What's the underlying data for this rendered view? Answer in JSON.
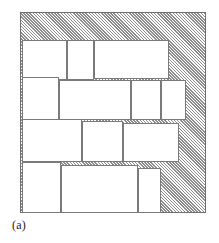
{
  "figure": {
    "caption": "(a)",
    "type": "two-dimensional-packing-diagram",
    "container": {
      "name": "stock-sheet",
      "fill": "diagonal-hatch",
      "hatch_color": "#8b8b8b",
      "border_color": "#6f6f6f",
      "x": 20,
      "y": 12,
      "width": 186,
      "height": 201
    },
    "piece_style": {
      "fill": "#ffffff",
      "border_color": "#7a7a7a"
    },
    "rows": [
      {
        "name": "row-1",
        "pieces": [
          {
            "label": "piece-1-1",
            "x": 1,
            "y": 27,
            "width": 45,
            "height": 40
          },
          {
            "label": "piece-1-2",
            "x": 46,
            "y": 27,
            "width": 27,
            "height": 40
          },
          {
            "label": "piece-1-3",
            "x": 73,
            "y": 27,
            "width": 75,
            "height": 39
          }
        ]
      },
      {
        "name": "row-2",
        "pieces": [
          {
            "label": "piece-2-1",
            "x": 1,
            "y": 64,
            "width": 37,
            "height": 43
          },
          {
            "label": "piece-2-2",
            "x": 38,
            "y": 67,
            "width": 72,
            "height": 40
          },
          {
            "label": "piece-2-3",
            "x": 110,
            "y": 67,
            "width": 30,
            "height": 40
          },
          {
            "label": "piece-2-4",
            "x": 140,
            "y": 67,
            "width": 25,
            "height": 40
          }
        ]
      },
      {
        "name": "row-3",
        "pieces": [
          {
            "label": "piece-3-1",
            "x": 1,
            "y": 106,
            "width": 60,
            "height": 43
          },
          {
            "label": "piece-3-2",
            "x": 61,
            "y": 108,
            "width": 41,
            "height": 41
          },
          {
            "label": "piece-3-3",
            "x": 102,
            "y": 110,
            "width": 56,
            "height": 39
          }
        ]
      },
      {
        "name": "row-4",
        "pieces": [
          {
            "label": "piece-4-1",
            "x": 1,
            "y": 149,
            "width": 39,
            "height": 51
          },
          {
            "label": "piece-4-2",
            "x": 40,
            "y": 152,
            "width": 77,
            "height": 48
          },
          {
            "label": "piece-4-3",
            "x": 117,
            "y": 155,
            "width": 23,
            "height": 45
          }
        ]
      }
    ]
  }
}
